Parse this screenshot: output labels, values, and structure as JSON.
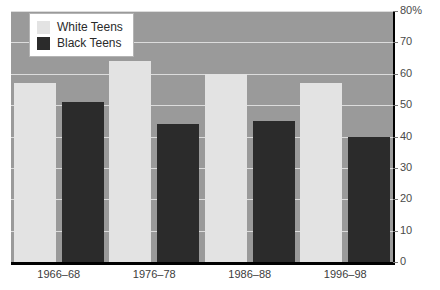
{
  "chart_data": {
    "type": "bar",
    "title": "",
    "xlabel": "",
    "ylabel": "",
    "ylim": [
      0,
      80
    ],
    "y_ticks": [
      "0",
      "10",
      "20",
      "30",
      "40",
      "50",
      "60",
      "70",
      "80%"
    ],
    "y_tick_values": [
      0,
      10,
      20,
      30,
      40,
      50,
      60,
      70,
      80
    ],
    "grid": true,
    "legend_position": "top-left",
    "categories": [
      "1966–68",
      "1976–78",
      "1986–88",
      "1996–98"
    ],
    "series": [
      {
        "name": "White Teens",
        "color": "#e3e3e3",
        "values": [
          57,
          64,
          60,
          57
        ]
      },
      {
        "name": "Black Teens",
        "color": "#2b2b2b",
        "values": [
          51,
          44,
          45,
          40
        ]
      }
    ]
  },
  "colors": {
    "plot_background": "#9a9a9a",
    "gridline": "#dcdcdc",
    "axis": "#000000",
    "page_background": "#ffffff",
    "tick_label": "#4a4a4a"
  }
}
